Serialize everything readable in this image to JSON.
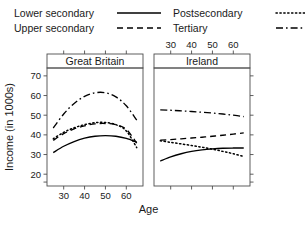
{
  "legend": {
    "entries": [
      {
        "label": "Lower secondary",
        "style": "solid",
        "key_name": "legend-key-solid"
      },
      {
        "label": "Upper secondary",
        "style": "dashed",
        "key_name": "legend-key-dashed"
      },
      {
        "label": "Postsecondary",
        "style": "dotted",
        "key_name": "legend-key-dotted"
      },
      {
        "label": "Tertiary",
        "style": "dashdot",
        "key_name": "legend-key-dashdot"
      }
    ]
  },
  "axes": {
    "ylabel": "Income (in 1000s)",
    "xlabel": "Age",
    "yticks": [
      "70",
      "60",
      "50",
      "40",
      "30",
      "20"
    ],
    "xticks_bottom": [
      "30",
      "40",
      "50",
      "60"
    ],
    "xticks_top": [
      "30",
      "40",
      "50",
      "60"
    ]
  },
  "panels": [
    {
      "strip": "Great Britain"
    },
    {
      "strip": "Ireland"
    }
  ],
  "chart_data": {
    "type": "line",
    "title": "",
    "xlabel": "Age",
    "ylabel": "Income (in 1000s)",
    "xlim": [
      22,
      68
    ],
    "ylim": [
      14,
      74
    ],
    "xticks": [
      30,
      40,
      50,
      60
    ],
    "yticks": [
      20,
      30,
      40,
      50,
      60,
      70
    ],
    "grid": false,
    "legend_position": "top",
    "panels": [
      {
        "name": "Great Britain",
        "x": [
          25,
          30,
          35,
          40,
          45,
          50,
          55,
          60,
          65
        ],
        "series": [
          {
            "name": "Lower secondary",
            "style": "solid",
            "values": [
              31.0,
              34.2,
              36.6,
              38.3,
              39.3,
              39.6,
              39.3,
              38.2,
              36.3
            ]
          },
          {
            "name": "Upper secondary",
            "style": "dashed",
            "values": [
              37.2,
              40.6,
              43.0,
              44.6,
              45.6,
              45.8,
              45.2,
              42.8,
              35.8
            ]
          },
          {
            "name": "Postsecondary",
            "style": "dotted",
            "values": [
              38.0,
              41.3,
              43.6,
              45.2,
              46.2,
              46.3,
              45.2,
              42.0,
              33.5
            ]
          },
          {
            "name": "Tertiary",
            "style": "dashdot",
            "values": [
              43.5,
              50.6,
              56.0,
              59.6,
              61.4,
              61.4,
              59.3,
              54.8,
              47.5
            ]
          }
        ]
      },
      {
        "name": "Ireland",
        "x": [
          25,
          30,
          35,
          40,
          45,
          50,
          55,
          60,
          65
        ],
        "series": [
          {
            "name": "Lower secondary",
            "style": "solid",
            "values": [
              26.7,
              28.8,
              30.4,
              31.6,
              32.4,
              32.9,
              33.2,
              33.3,
              33.3
            ]
          },
          {
            "name": "Upper secondary",
            "style": "dashed",
            "values": [
              37.3,
              37.6,
              38.0,
              38.4,
              38.8,
              39.3,
              39.8,
              40.4,
              41.0
            ]
          },
          {
            "name": "Postsecondary",
            "style": "dotted",
            "values": [
              37.0,
              36.2,
              35.4,
              34.6,
              33.7,
              32.7,
              31.6,
              30.4,
              29.0
            ]
          },
          {
            "name": "Tertiary",
            "style": "dashdot",
            "values": [
              52.7,
              52.5,
              52.2,
              51.9,
              51.5,
              51.1,
              50.6,
              50.0,
              49.3
            ]
          }
        ]
      }
    ]
  }
}
